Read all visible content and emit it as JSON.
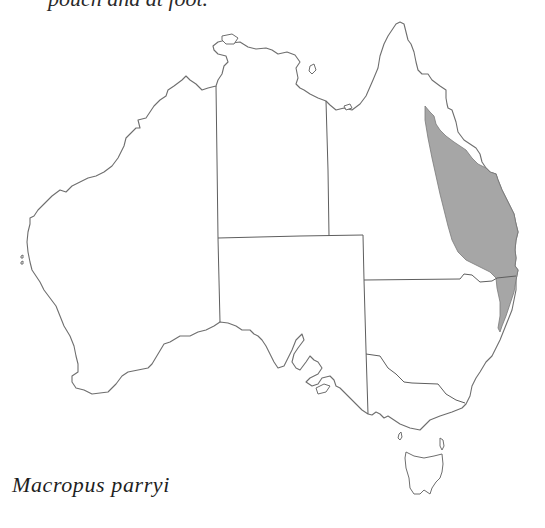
{
  "text": {
    "top_caption_fragment": "pouch  and at foot.",
    "species_name": "Macropus parryi"
  },
  "map": {
    "subject": "Distribution map of Australia",
    "regions": [
      "Western Australia",
      "Northern Territory",
      "Queensland",
      "South Australia",
      "New South Wales",
      "Victoria",
      "Tasmania"
    ],
    "highlighted_range": {
      "description": "Eastern coastal Queensland into northern New South Wales",
      "fill_color": "#a6a6a6"
    },
    "coast_color": "#6e6e6e",
    "background_color": "#ffffff"
  }
}
